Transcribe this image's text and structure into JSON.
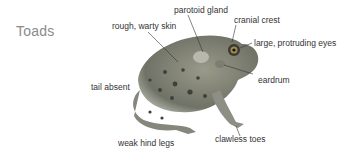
{
  "title": "Toads",
  "labels": {
    "parotoid_gland": "parotoid gland",
    "cranial_crest": "cranial crest",
    "rough_skin": "rough, warty skin",
    "eyes": "large, protruding eyes",
    "eardrum": "eardrum",
    "tail": "tail absent",
    "hind_legs": "weak hind legs",
    "toes": "clawless toes"
  },
  "icon": "toad-illustration"
}
